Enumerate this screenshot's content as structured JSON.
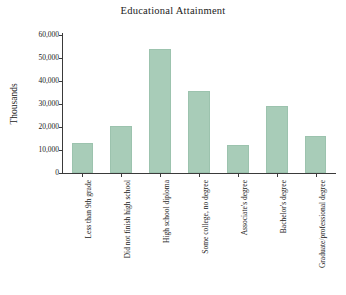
{
  "chart_data": {
    "type": "bar",
    "title": "Educational Attainment",
    "xlabel": "",
    "ylabel": "Thousands",
    "ylim": [
      0,
      60000
    ],
    "yticks": [
      0,
      10000,
      20000,
      30000,
      40000,
      50000,
      60000
    ],
    "ytick_labels": [
      "0",
      "10,000",
      "20,000",
      "30,000",
      "40,000",
      "50,000",
      "60,000"
    ],
    "grid": false,
    "legend": null,
    "bar_color": "#a8ccb8",
    "categories": [
      "Less than 9th grade",
      "Did not finish high school",
      "High school diploma",
      "Some college, no degree",
      "Associate's degree",
      "Bachelor's degree",
      "Graduate/professional degree"
    ],
    "values": [
      13000,
      20500,
      54000,
      35500,
      12000,
      29000,
      16000
    ]
  }
}
